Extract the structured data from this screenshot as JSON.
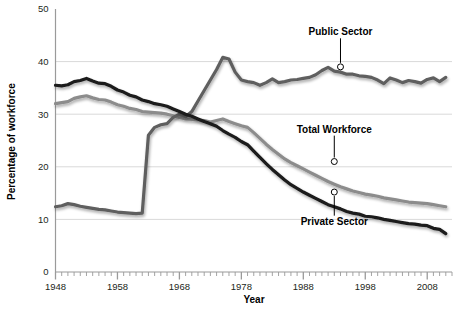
{
  "chart_data": {
    "type": "line",
    "title": "",
    "xlabel": "Year",
    "ylabel": "Percentage of workforce",
    "xlim": [
      1948,
      2012
    ],
    "ylim": [
      0,
      50
    ],
    "grid": true,
    "legend_position": "inline-annotations",
    "x_ticks_major": [
      "1948",
      "1958",
      "1968",
      "1978",
      "1988",
      "1998",
      "2008"
    ],
    "x_tick_values_major": [
      1948,
      1958,
      1968,
      1978,
      1988,
      1998,
      2008
    ],
    "x_tick_minor_step": 1,
    "y_ticks": [
      "0",
      "10",
      "20",
      "30",
      "40",
      "50"
    ],
    "y_tick_values": [
      0,
      10,
      20,
      30,
      40,
      50
    ],
    "x": [
      1948,
      1949,
      1950,
      1951,
      1952,
      1953,
      1954,
      1955,
      1956,
      1957,
      1958,
      1959,
      1960,
      1961,
      1962,
      1963,
      1964,
      1965,
      1966,
      1967,
      1968,
      1969,
      1970,
      1971,
      1972,
      1973,
      1974,
      1975,
      1976,
      1977,
      1978,
      1979,
      1980,
      1981,
      1982,
      1983,
      1984,
      1985,
      1986,
      1987,
      1988,
      1989,
      1990,
      1991,
      1992,
      1993,
      1994,
      1995,
      1996,
      1997,
      1998,
      1999,
      2000,
      2001,
      2002,
      2003,
      2004,
      2005,
      2006,
      2007,
      2008,
      2009,
      2010,
      2011
    ],
    "series": [
      {
        "name": "Private Sector",
        "color": "#1a1a1a",
        "width": 3.2,
        "label_anchor": {
          "x": 1993,
          "y": 15.2
        },
        "label_text_pos": {
          "x": 1993,
          "y": 9.0
        },
        "values": [
          35.5,
          35.4,
          35.6,
          36.2,
          36.4,
          36.8,
          36.3,
          35.9,
          35.8,
          35.3,
          34.6,
          34.2,
          33.6,
          33.3,
          32.7,
          32.4,
          32.0,
          31.8,
          31.5,
          31.0,
          30.5,
          30.0,
          29.6,
          29.1,
          28.6,
          28.2,
          27.7,
          26.9,
          26.2,
          25.6,
          24.8,
          24.2,
          23.0,
          21.8,
          20.6,
          19.5,
          18.5,
          17.5,
          16.6,
          15.9,
          15.2,
          14.6,
          14.0,
          13.4,
          12.8,
          12.4,
          12.0,
          11.5,
          11.2,
          11.0,
          10.6,
          10.5,
          10.3,
          10.0,
          9.8,
          9.6,
          9.4,
          9.2,
          9.1,
          8.9,
          8.8,
          8.3,
          8.1,
          7.3
        ]
      },
      {
        "name": "Total Workforce",
        "color": "#8c8c8c",
        "width": 3.2,
        "label_anchor": {
          "x": 1993,
          "y": 21.0
        },
        "label_text_pos": {
          "x": 1993,
          "y": 26.5
        },
        "values": [
          32.0,
          32.2,
          32.4,
          33.0,
          33.3,
          33.5,
          33.1,
          32.8,
          32.7,
          32.3,
          31.8,
          31.5,
          31.1,
          30.9,
          30.5,
          30.4,
          30.3,
          30.2,
          30.0,
          29.7,
          29.4,
          29.1,
          29.0,
          28.9,
          28.8,
          28.5,
          28.8,
          29.1,
          28.6,
          28.2,
          27.8,
          27.5,
          26.5,
          25.4,
          24.3,
          23.3,
          22.4,
          21.5,
          20.8,
          20.2,
          19.6,
          19.0,
          18.4,
          17.8,
          17.2,
          16.7,
          16.2,
          15.8,
          15.4,
          15.1,
          14.8,
          14.6,
          14.4,
          14.1,
          13.9,
          13.7,
          13.5,
          13.3,
          13.2,
          13.1,
          13.0,
          12.8,
          12.6,
          12.4
        ]
      },
      {
        "name": "Public Sector",
        "color": "#5f5f5f",
        "width": 3.2,
        "label_anchor": {
          "x": 1994,
          "y": 39.0
        },
        "label_text_pos": {
          "x": 1994,
          "y": 45.0
        },
        "values": [
          12.4,
          12.6,
          13.0,
          12.8,
          12.5,
          12.3,
          12.1,
          11.9,
          11.8,
          11.6,
          11.4,
          11.3,
          11.2,
          11.1,
          11.2,
          26.0,
          27.5,
          28.0,
          28.2,
          29.4,
          30.0,
          29.5,
          30.5,
          32.5,
          34.5,
          36.5,
          38.5,
          40.8,
          40.5,
          38.0,
          36.5,
          36.2,
          36.0,
          35.5,
          36.0,
          36.7,
          36.0,
          36.2,
          36.5,
          36.6,
          36.8,
          37.0,
          37.5,
          38.3,
          38.9,
          38.2,
          38.0,
          37.6,
          37.6,
          37.3,
          37.2,
          37.0,
          36.5,
          35.8,
          36.9,
          36.5,
          36.0,
          36.4,
          36.2,
          35.9,
          36.6,
          36.9,
          36.2,
          37.0
        ]
      }
    ]
  },
  "axis": {
    "y_title": "Percentage of workforce",
    "x_title": "Year"
  },
  "annotations": [
    {
      "id": "public-sector",
      "text": "Public Sector"
    },
    {
      "id": "total-workforce",
      "text": "Total Workforce"
    },
    {
      "id": "private-sector",
      "text": "Private Sector"
    }
  ],
  "colors": {
    "private_sector": "#1a1a1a",
    "total_workforce": "#8c8c8c",
    "public_sector": "#5f5f5f",
    "grid": "#d9d9d9",
    "axis": "#9a9a9a",
    "text": "#231f20",
    "background": "#ffffff"
  }
}
